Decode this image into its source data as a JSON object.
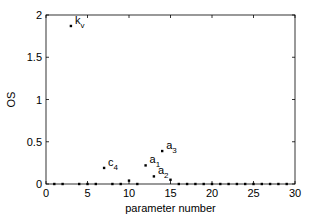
{
  "chart_data": {
    "type": "scatter",
    "title": "",
    "xlabel": "parameter number",
    "ylabel": "OS",
    "xlim": [
      0,
      30
    ],
    "ylim": [
      0,
      2
    ],
    "xticks": [
      0,
      5,
      10,
      15,
      20,
      25,
      30
    ],
    "yticks": [
      0,
      0.5,
      1,
      1.5,
      2
    ],
    "ytick_labels": [
      "0",
      "0.5",
      "1",
      "1.5",
      "2"
    ],
    "grid": false,
    "legend": null,
    "points": [
      {
        "x": 1,
        "y": 0.0
      },
      {
        "x": 2,
        "y": 0.0
      },
      {
        "x": 3,
        "y": 1.87,
        "label": "k",
        "label_sub": "v"
      },
      {
        "x": 4,
        "y": 0.0
      },
      {
        "x": 5,
        "y": 0.0
      },
      {
        "x": 6,
        "y": 0.0
      },
      {
        "x": 7,
        "y": 0.19,
        "label": "c",
        "label_sub": "4"
      },
      {
        "x": 8,
        "y": 0.0
      },
      {
        "x": 9,
        "y": 0.0
      },
      {
        "x": 10,
        "y": 0.04
      },
      {
        "x": 11,
        "y": 0.0
      },
      {
        "x": 12,
        "y": 0.22,
        "label": "a",
        "label_sub": "1"
      },
      {
        "x": 13,
        "y": 0.09,
        "label": "a",
        "label_sub": "2"
      },
      {
        "x": 14,
        "y": 0.39,
        "label": "a",
        "label_sub": "3"
      },
      {
        "x": 15,
        "y": 0.05
      },
      {
        "x": 16,
        "y": 0.0
      },
      {
        "x": 17,
        "y": 0.0
      },
      {
        "x": 18,
        "y": 0.0
      },
      {
        "x": 19,
        "y": 0.0
      },
      {
        "x": 20,
        "y": 0.0
      },
      {
        "x": 21,
        "y": 0.0
      },
      {
        "x": 22,
        "y": 0.0
      },
      {
        "x": 23,
        "y": 0.0
      },
      {
        "x": 24,
        "y": 0.0
      },
      {
        "x": 25,
        "y": 0.0
      },
      {
        "x": 26,
        "y": 0.0
      },
      {
        "x": 27,
        "y": 0.0
      },
      {
        "x": 28,
        "y": 0.0
      },
      {
        "x": 29,
        "y": 0.0
      }
    ],
    "colors": {
      "marker": "#000000",
      "axis": "#000000",
      "background": "#ffffff"
    }
  }
}
